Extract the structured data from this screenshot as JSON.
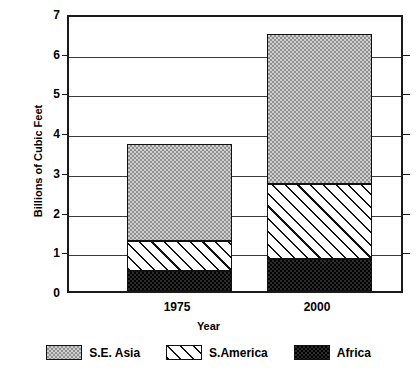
{
  "chart_data": {
    "type": "bar",
    "subtype": "stacked-bar",
    "title": "",
    "xlabel": "Year",
    "ylabel": "Billions of Cubic Feet",
    "categories": [
      "1975",
      "2000"
    ],
    "series": [
      {
        "name": "Africa",
        "values": [
          0.5,
          0.8
        ]
      },
      {
        "name": "S.America",
        "values": [
          0.75,
          1.9
        ]
      },
      {
        "name": "S.E. Asia",
        "values": [
          2.45,
          3.78
        ]
      }
    ],
    "stack_order_bottom_to_top": [
      "Africa",
      "S.America",
      "S.E. Asia"
    ],
    "totals": [
      3.7,
      6.48
    ],
    "ylim": [
      0,
      7
    ],
    "yticks": [
      0,
      1,
      2,
      3,
      4,
      5,
      6,
      7
    ],
    "ytick_labels": [
      "0",
      "1",
      "2",
      "3",
      "4",
      "5",
      "6",
      "7"
    ],
    "grid": true,
    "grid_axis": "y",
    "legend_position": "bottom",
    "legend_entries": [
      "S.E. Asia",
      "S.America",
      "Africa"
    ],
    "patterns": {
      "S.E. Asia": "light-gray-dither",
      "S.America": "diagonal-hatch",
      "Africa": "dark-dither"
    },
    "colors": {
      "S.E. Asia": "#cfcfcf",
      "S.America": "#ffffff",
      "Africa": "#2b2b2b",
      "axis": "#1a1a1a",
      "grid": "#3a3a3a",
      "background": "#ffffff"
    }
  }
}
